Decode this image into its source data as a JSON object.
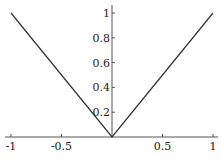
{
  "chart_data": {
    "type": "line",
    "title": "",
    "xlabel": "",
    "ylabel": "",
    "x": [
      -1,
      -0.5,
      0,
      0.5,
      1
    ],
    "series": [
      {
        "name": "|x|",
        "values": [
          1,
          0.5,
          0,
          0.5,
          1
        ]
      }
    ],
    "xlim": [
      -1,
      1
    ],
    "ylim": [
      0,
      1
    ],
    "xticks": [
      "-1",
      "-0.5",
      "0.5",
      "1"
    ],
    "yticks": [
      "0.2",
      "0.4",
      "0.6",
      "0.8",
      "1"
    ],
    "grid": false,
    "legend": null
  },
  "colors": {
    "line": "#333333",
    "axis": "#555555"
  }
}
